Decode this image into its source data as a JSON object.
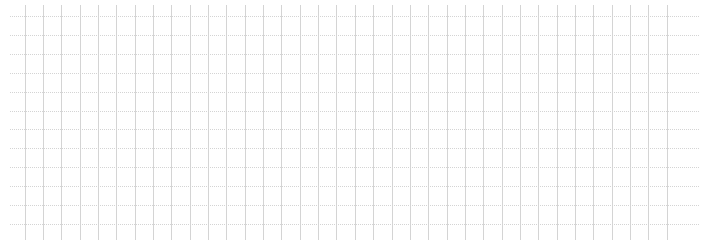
{
  "grid": {
    "line_color": "#d4d4d4",
    "background_color": "#ffffff",
    "style": "dotted",
    "horizontal_line_count": 12,
    "vertical_line_count": 36
  }
}
